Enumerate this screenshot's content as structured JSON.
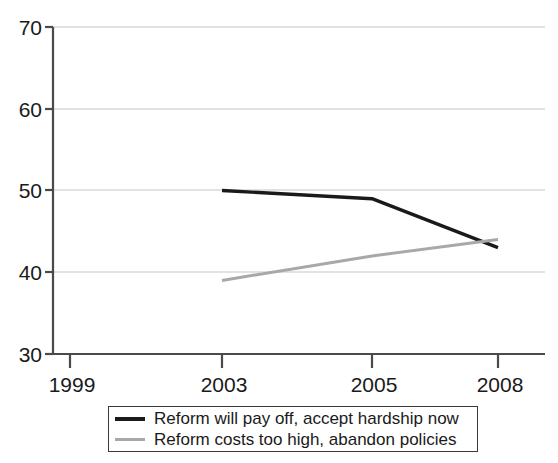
{
  "chart_data": {
    "type": "line",
    "title": "",
    "subtitle": "",
    "xlabel": "",
    "ylabel": "",
    "x": [
      "1999",
      "2003",
      "2005",
      "2008"
    ],
    "xtick_labels": [
      "1999",
      "2003",
      "2005",
      "2008"
    ],
    "ytick_labels": [
      "30",
      "40",
      "50",
      "60",
      "70"
    ],
    "yticks": [
      30,
      40,
      50,
      60,
      70
    ],
    "ylim": [
      30,
      70
    ],
    "grid": "horizontal",
    "legend_position": "below-axes",
    "series": [
      {
        "name": "Reform will pay off, accept hardship now",
        "color": "#1a1a1a",
        "values": [
          null,
          50,
          49,
          43
        ],
        "points": [
          {
            "x": "2003",
            "y": 50
          },
          {
            "x": "2005",
            "y": 49
          },
          {
            "x": "2008",
            "y": 43
          }
        ]
      },
      {
        "name": "Reform costs too high, abandon policies",
        "color": "#a8a8a8",
        "values": [
          null,
          39,
          42,
          44
        ],
        "points": [
          {
            "x": "2003",
            "y": 39
          },
          {
            "x": "2005",
            "y": 42
          },
          {
            "x": "2008",
            "y": 44
          }
        ]
      }
    ]
  },
  "axes": {
    "y_labels": [
      {
        "value": "70"
      },
      {
        "value": "60"
      },
      {
        "value": "50"
      },
      {
        "value": "40"
      },
      {
        "value": "30"
      }
    ],
    "x_labels": [
      {
        "value": "1999"
      },
      {
        "value": "2003"
      },
      {
        "value": "2005"
      },
      {
        "value": "2008"
      }
    ]
  },
  "legend": {
    "entries": [
      {
        "label": "Reform will pay off, accept hardship now",
        "color": "#1a1a1a"
      },
      {
        "label": "Reform costs too high, abandon policies",
        "color": "#a8a8a8"
      }
    ]
  },
  "colors": {
    "series_black": "#1a1a1a",
    "series_gray": "#a8a8a8",
    "gridline": "#d9d9d9",
    "axis": "#4a4a4a",
    "background": "#ffffff"
  }
}
